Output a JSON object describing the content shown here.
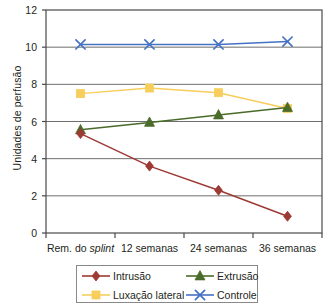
{
  "chart_data": {
    "type": "line",
    "title": "",
    "xlabel": "",
    "ylabel": "Unidades de perfusão",
    "categories": [
      "Rem. do splint",
      "12 semanas",
      "24 semanas",
      "36 semanas"
    ],
    "category_labels_html": [
      "Rem. do <i>splint</i>",
      "12 semanas",
      "24 semanas",
      "36 semanas"
    ],
    "ylim": [
      0,
      12
    ],
    "yticks": [
      0,
      2,
      4,
      6,
      8,
      10,
      12
    ],
    "ytick_labels": [
      "0",
      "2",
      "4",
      "6",
      "8",
      "10",
      "12"
    ],
    "grid": "horizontal",
    "legend_position": "bottom",
    "series": [
      {
        "name": "Intrusão",
        "values": [
          5.35,
          3.6,
          2.3,
          0.9
        ],
        "color": "#9C3A33",
        "marker": "diamond"
      },
      {
        "name": "Luxação lateral",
        "values": [
          7.5,
          7.8,
          7.55,
          6.7
        ],
        "color": "#F7CE5B",
        "marker": "square"
      },
      {
        "name": "Extrusão",
        "values": [
          5.55,
          5.95,
          6.35,
          6.75
        ],
        "color": "#4A6B2A",
        "marker": "triangle"
      },
      {
        "name": "Controle",
        "values": [
          10.15,
          10.15,
          10.15,
          10.3
        ],
        "color": "#4472C4",
        "marker": "x"
      }
    ]
  },
  "legend": {
    "items": [
      {
        "label": "Intrusão",
        "color": "#9C3A33",
        "marker": "diamond"
      },
      {
        "label": "Extrusão",
        "color": "#4A6B2A",
        "marker": "triangle"
      },
      {
        "label": "Luxação lateral",
        "color": "#F7CE5B",
        "marker": "square"
      },
      {
        "label": "Controle",
        "color": "#4472C4",
        "marker": "x"
      }
    ]
  },
  "axes": {
    "y_title": "Unidades de perfusão"
  }
}
